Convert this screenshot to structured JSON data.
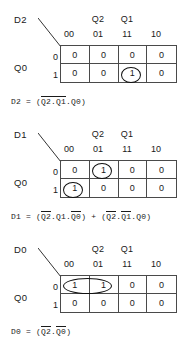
{
  "common": {
    "group_header_left": "Q2",
    "group_header_right": "Q1",
    "col_headers": [
      "00",
      "01",
      "11",
      "10"
    ],
    "row_headers": [
      "0",
      "1"
    ],
    "row_variable": "Q0"
  },
  "maps": [
    {
      "id": "d2",
      "output_label": "D2",
      "cells": [
        [
          "0",
          "0",
          "0",
          "0"
        ],
        [
          "0",
          "0",
          "1",
          "0"
        ]
      ],
      "equation": {
        "lhs": "D2",
        "eq": "=",
        "open": "(",
        "terms": [
          {
            "bar": true,
            "text": "Q2.Q1"
          },
          {
            "bar": false,
            "text": ".Q0"
          }
        ],
        "close": ")",
        "plain": "D2 = (Q2.Q1.Q0)"
      }
    },
    {
      "id": "d1",
      "output_label": "D1",
      "cells": [
        [
          "0",
          "1",
          "0",
          "0"
        ],
        [
          "1",
          "0",
          "0",
          "0"
        ]
      ],
      "equation": {
        "lhs": "D1",
        "eq": "=",
        "plus": "+",
        "term1": {
          "open": "(",
          "parts": [
            {
              "bar": true,
              "text": "Q2"
            },
            {
              "bar": false,
              "text": ".Q1."
            },
            {
              "bar": true,
              "text": "Q0"
            }
          ],
          "close": ")"
        },
        "term2": {
          "open": "(",
          "parts": [
            {
              "bar": true,
              "text": "Q2"
            },
            {
              "bar": false,
              "text": "."
            },
            {
              "bar": true,
              "text": "Q1"
            },
            {
              "bar": false,
              "text": ".Q0"
            }
          ],
          "close": ")"
        },
        "plain": "D1 = (Q2.Q1.Q0) + (Q2.Q1.Q0)"
      }
    },
    {
      "id": "d0",
      "output_label": "D0",
      "cells": [
        [
          "1",
          "1",
          "0",
          "0"
        ],
        [
          "0",
          "0",
          "0",
          "0"
        ]
      ],
      "equation": {
        "lhs": "D0",
        "eq": "=",
        "open": "(",
        "parts": [
          {
            "bar": true,
            "text": "Q2"
          },
          {
            "bar": false,
            "text": "."
          },
          {
            "bar": true,
            "text": "Q0"
          }
        ],
        "close": ")",
        "plain": "D0 = (Q2.Q0)"
      }
    }
  ],
  "colors": {
    "grid_line": "#4a4a4a",
    "ring": "#111111",
    "text": "#1a1a1a",
    "background": "#ffffff"
  }
}
